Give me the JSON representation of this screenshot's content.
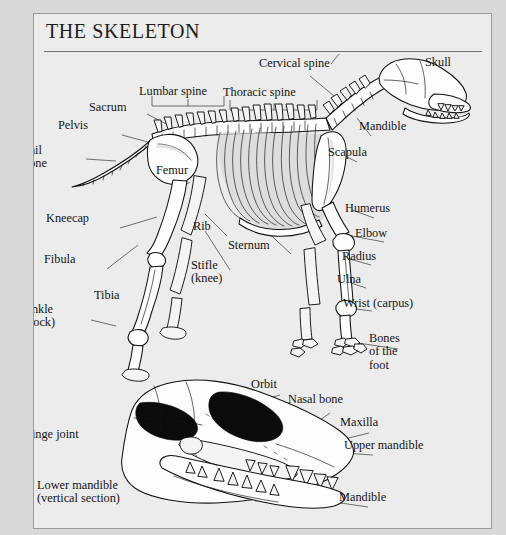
{
  "plate": {
    "title": "THE SKELETON",
    "background_color": "#ececec",
    "page_color": "#d9d9d9",
    "border_color": "#9a9a9a",
    "ink_color": "#111111"
  },
  "figures": [
    {
      "id": "skeleton-figure",
      "name": "dog-skeleton-lateral-view",
      "caption": ""
    },
    {
      "id": "skull-figure",
      "name": "dog-skull-vertical-section",
      "caption": ""
    }
  ],
  "skeleton_labels": [
    {
      "key": "cervical_spine",
      "text": "Cervical spine",
      "x": 258,
      "y": 56,
      "align": "left"
    },
    {
      "key": "skull",
      "text": "Skull",
      "x": 424,
      "y": 55,
      "align": "left"
    },
    {
      "key": "thoracic_spine",
      "text": "Thoracic spine",
      "x": 222,
      "y": 85,
      "align": "left"
    },
    {
      "key": "lumbar_spine",
      "text": "Lumbar spine",
      "x": 138,
      "y": 84,
      "align": "left"
    },
    {
      "key": "sacrum",
      "text": "Sacrum",
      "x": 88,
      "y": 100,
      "align": "left"
    },
    {
      "key": "mandible",
      "text": "Mandible",
      "x": 358,
      "y": 119,
      "align": "left"
    },
    {
      "key": "pelvis",
      "text": "Pelvis",
      "x": 57,
      "y": 118,
      "align": "left"
    },
    {
      "key": "tail_bone",
      "text": "Tail\nbone",
      "x": 22,
      "y": 143,
      "align": "left"
    },
    {
      "key": "scapula",
      "text": "Scapula",
      "x": 327,
      "y": 145,
      "align": "left"
    },
    {
      "key": "femur",
      "text": "Femur",
      "x": 155,
      "y": 163,
      "align": "left"
    },
    {
      "key": "humerus",
      "text": "Humerus",
      "x": 344,
      "y": 201,
      "align": "left"
    },
    {
      "key": "kneecap",
      "text": "Kneecap",
      "x": 45,
      "y": 211,
      "align": "left"
    },
    {
      "key": "rib",
      "text": "Rib",
      "x": 192,
      "y": 219,
      "align": "left"
    },
    {
      "key": "elbow",
      "text": "Elbow",
      "x": 354,
      "y": 226,
      "align": "left"
    },
    {
      "key": "sternum",
      "text": "Sternum",
      "x": 227,
      "y": 238,
      "align": "left"
    },
    {
      "key": "radius",
      "text": "Radius",
      "x": 341,
      "y": 249,
      "align": "left"
    },
    {
      "key": "fibula",
      "text": "Fibula",
      "x": 43,
      "y": 252,
      "align": "left"
    },
    {
      "key": "stifle_knee",
      "text": "Stifle\n(knee)",
      "x": 190,
      "y": 258,
      "align": "left"
    },
    {
      "key": "ulna",
      "text": "Ulna",
      "x": 336,
      "y": 272,
      "align": "left"
    },
    {
      "key": "tibia",
      "text": "Tibia",
      "x": 93,
      "y": 288,
      "align": "left"
    },
    {
      "key": "wrist_carpus",
      "text": "Wrist (carpus)",
      "x": 342,
      "y": 296,
      "align": "left"
    },
    {
      "key": "ankle_hock",
      "text": "Ankle\n(hock)",
      "x": 22,
      "y": 302,
      "align": "left"
    },
    {
      "key": "bones_of_foot",
      "text": "Bones\nof the\nfoot",
      "x": 368,
      "y": 331,
      "align": "left"
    }
  ],
  "skull_labels": [
    {
      "key": "orbit",
      "text": "Orbit",
      "x": 250,
      "y": 377,
      "align": "left"
    },
    {
      "key": "nasal_bone",
      "text": "Nasal bone",
      "x": 287,
      "y": 392,
      "align": "left"
    },
    {
      "key": "maxilla",
      "text": "Maxilla",
      "x": 339,
      "y": 415,
      "align": "left"
    },
    {
      "key": "hinge_joint",
      "text": "Hinge joint",
      "x": 22,
      "y": 427,
      "align": "left"
    },
    {
      "key": "upper_mandible",
      "text": "Upper mandible",
      "x": 343,
      "y": 438,
      "align": "left"
    },
    {
      "key": "lower_mandible",
      "text": "Lower mandible\n(vertical section)",
      "x": 36,
      "y": 478,
      "align": "left"
    },
    {
      "key": "mandible_skull",
      "text": "Mandible",
      "x": 338,
      "y": 490,
      "align": "left"
    }
  ]
}
